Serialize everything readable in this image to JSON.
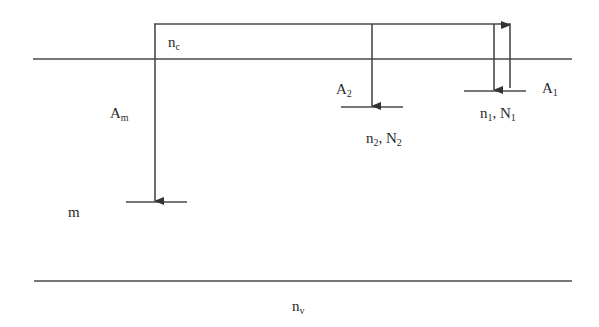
{
  "diagram": {
    "type": "energy-level-diagram",
    "colors": {
      "line": "#4a4a4a",
      "text": "#2a2a2a",
      "background": "#ffffff"
    },
    "levels": {
      "conduction_band": {
        "label": "n",
        "sub": "c"
      },
      "valence_band": {
        "label": "n",
        "sub": "v"
      },
      "level_m": {
        "label": "m"
      },
      "level_2": {
        "label": "n",
        "sub": "2",
        "label2": ", N",
        "sub2": "2"
      },
      "level_1": {
        "label": "n",
        "sub": "1",
        "label2": ", N",
        "sub2": "1"
      }
    },
    "transitions": {
      "A_m": {
        "label": "A",
        "sub": "m",
        "direction": "down"
      },
      "A_2": {
        "label": "A",
        "sub": "2",
        "direction": "down"
      },
      "A_1": {
        "label": "A",
        "sub": "1",
        "direction": "down/up"
      }
    }
  }
}
